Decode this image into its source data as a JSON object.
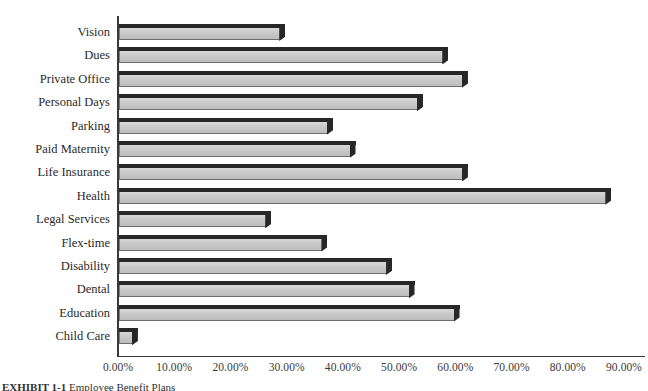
{
  "chart_data": {
    "type": "bar",
    "orientation": "horizontal",
    "title": "",
    "subtitle": "",
    "xlabel": "",
    "ylabel": "",
    "xlim": [
      0,
      90
    ],
    "grid": false,
    "legend": null,
    "categories": [
      "Vision",
      "Dues",
      "Private Office",
      "Personal Days",
      "Parking",
      "Paid Maternity",
      "Life Insurance",
      "Health",
      "Legal Services",
      "Flex-time",
      "Disability",
      "Dental",
      "Education",
      "Child Care"
    ],
    "values": [
      28.5,
      57.5,
      61.0,
      53.0,
      37.0,
      41.0,
      61.0,
      86.5,
      26.0,
      36.0,
      47.5,
      51.5,
      59.5,
      2.3
    ],
    "value_unit": "percent",
    "tick_labels": [
      "0.00%",
      "10.00%",
      "20.00%",
      "30.00%",
      "40.00%",
      "50.00%",
      "60.00%",
      "70.00%",
      "80.00%",
      "90.00%"
    ],
    "tick_values": [
      0,
      10,
      20,
      30,
      40,
      50,
      60,
      70,
      80,
      90
    ],
    "colors": {
      "bar_face": "#cbcbcb",
      "bar_shadow": "#272727",
      "axis": "#3a3a3a",
      "text": "#2a2a2a",
      "background": "#ffffff"
    }
  },
  "caption": {
    "figure_label": "EXHIBIT 1-1",
    "text": "Employee Benefit Plans"
  }
}
